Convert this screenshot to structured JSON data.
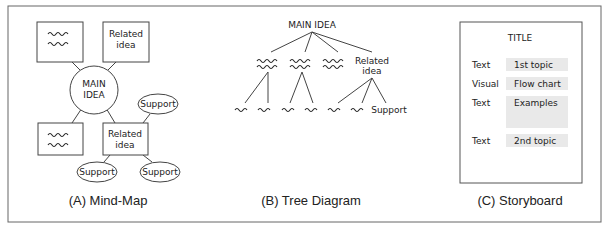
{
  "panels": {
    "mindmap": {
      "caption": "(A) Mind-Map",
      "main_idea": [
        "MAIN",
        "IDEA"
      ],
      "related_idea": [
        "Related",
        "idea"
      ],
      "support_labels": [
        "Support",
        "Support",
        "Support"
      ],
      "placeholder_glyph": "wavy-scribble"
    },
    "tree": {
      "caption": "(B) Tree Diagram",
      "root": "MAIN IDEA",
      "related_idea": [
        "Related",
        "idea"
      ],
      "support_label": "Support"
    },
    "storyboard": {
      "caption": "(C) Storyboard",
      "title": "TITLE",
      "rows": [
        {
          "type": "Text",
          "content": "1st topic"
        },
        {
          "type": "Visual",
          "content": "Flow chart"
        },
        {
          "type": "Text",
          "content": "Examples"
        },
        {
          "type": "Text",
          "content": "2nd topic"
        }
      ]
    }
  },
  "colors": {
    "stroke": "#555555",
    "fill_box": "#e9e9e9",
    "text": "#222222"
  }
}
